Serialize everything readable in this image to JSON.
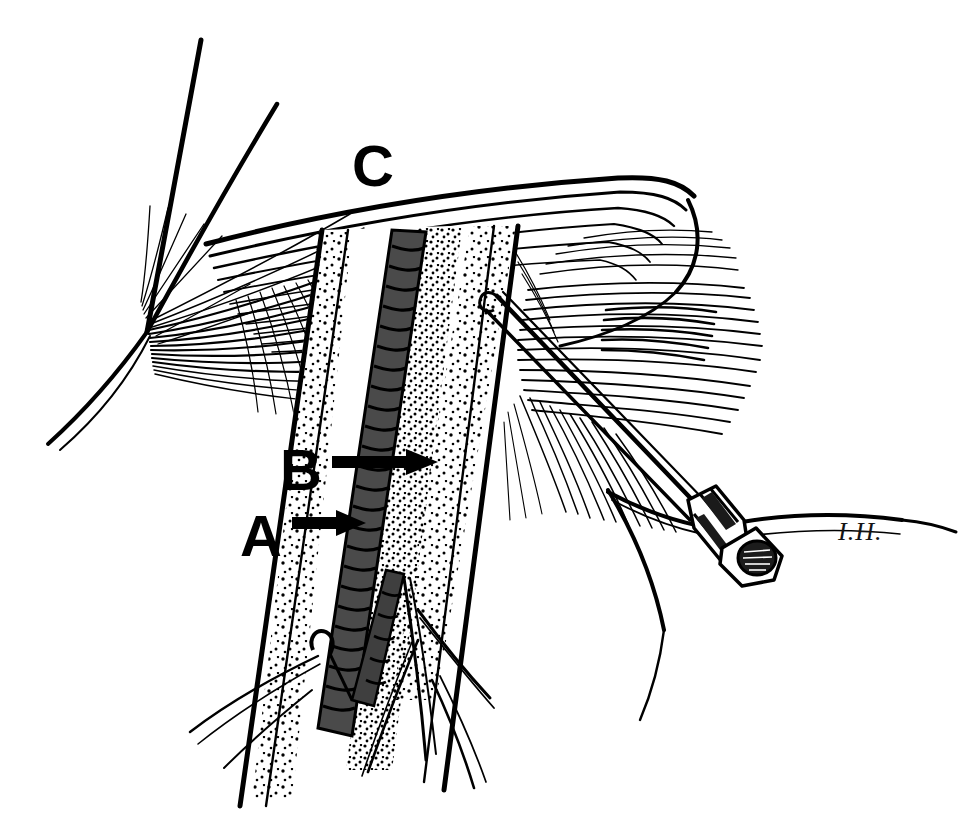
{
  "figure": {
    "kind": "pen-and-ink surgical illustration",
    "background_color": "#ffffff",
    "ink_color": "#000000",
    "vessel_fill_color": "#4a4a4a",
    "width": 974,
    "height": 830
  },
  "labels": [
    {
      "id": "label-a",
      "text": "A",
      "x": 262,
      "y": 545,
      "font_size": 54,
      "arrow": {
        "from_x": 292,
        "to_x": 352,
        "y": 523
      },
      "meaning": "artery"
    },
    {
      "id": "label-b",
      "text": "B",
      "x": 302,
      "y": 482,
      "font_size": 54,
      "arrow": {
        "from_x": 332,
        "to_x": 428,
        "y": 462
      },
      "meaning": "vein"
    },
    {
      "id": "label-c",
      "text": "C",
      "x": 358,
      "y": 180,
      "font_size": 54,
      "arrow": null,
      "meaning": "retracted fascial flap"
    }
  ],
  "signature": {
    "text": "I.H.",
    "x": 838,
    "y": 538
  },
  "annotations": {
    "instrument": "hypodermic syringe with needle",
    "needle_entry_x": 497,
    "needle_entry_y": 296,
    "syringe_hub_x": 712,
    "syringe_hub_y": 530
  }
}
